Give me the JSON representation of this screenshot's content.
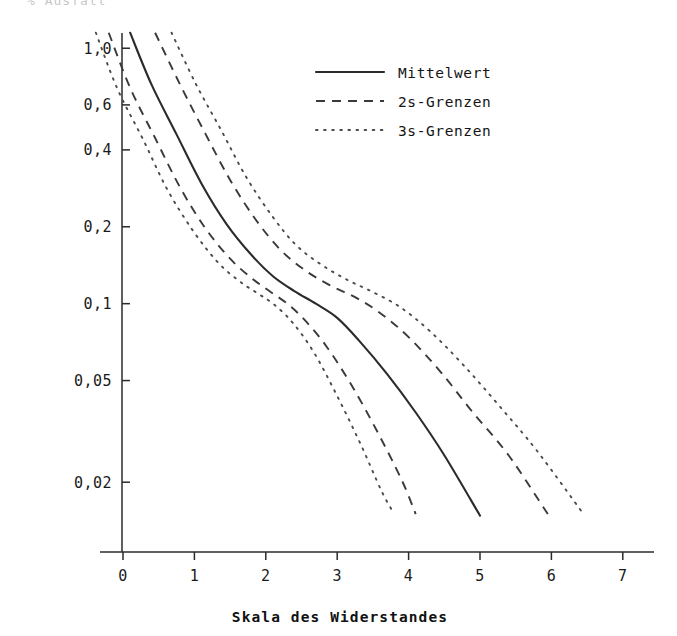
{
  "figure": {
    "top_caption": "% Ausfall",
    "background": "#ffffff",
    "ink": "#1a1a1a"
  },
  "legend": {
    "position": "top-right-inside",
    "items": [
      {
        "label": "Mittelwert",
        "style": "solid"
      },
      {
        "label": "2s-Grenzen",
        "style": "dashed"
      },
      {
        "label": "3s-Grenzen",
        "style": "dotted"
      }
    ]
  },
  "axes": {
    "x_title": "Skala des Widerstandes",
    "y_title": "",
    "x_ticks": [
      "0",
      "1",
      "2",
      "3",
      "4",
      "5",
      "6",
      "7"
    ],
    "y_ticks": [
      "1,0",
      "0,6",
      "0,4",
      "0,2",
      "0,1",
      "0,05",
      "0,02"
    ]
  },
  "chart_data": {
    "type": "line",
    "title": "",
    "subtitle": "",
    "xlabel": "Skala des Widerstandes",
    "ylabel": "",
    "xlim": [
      0,
      7
    ],
    "ylim": [
      0.013,
      1.2
    ],
    "yscale": "log",
    "xscale": "linear",
    "grid": false,
    "legend_position": "upper right",
    "xticks": [
      0,
      1,
      2,
      3,
      4,
      5,
      6,
      7
    ],
    "xticklabels": [
      "0",
      "1",
      "2",
      "3",
      "4",
      "5",
      "6",
      "7"
    ],
    "yticks": [
      1.0,
      0.6,
      0.4,
      0.2,
      0.1,
      0.05,
      0.02
    ],
    "yticklabels": [
      "1,0",
      "0,6",
      "0,4",
      "0,2",
      "0,1",
      "0,05",
      "0,02"
    ],
    "series": [
      {
        "name": "Mittelwert",
        "style": "solid",
        "color": "#2b2b2b",
        "x": [
          0.1,
          0.4,
          0.75,
          1.1,
          1.45,
          1.8,
          2.1,
          2.4,
          2.7,
          3.0,
          3.3,
          3.7,
          4.1,
          4.5,
          5.0
        ],
        "y": [
          1.15,
          0.72,
          0.46,
          0.295,
          0.205,
          0.155,
          0.128,
          0.112,
          0.1,
          0.088,
          0.072,
          0.053,
          0.0375,
          0.0255,
          0.0148
        ]
      },
      {
        "name": "2s-Grenzen (unten)",
        "style": "dashed",
        "color": "#3a3a3a",
        "x": [
          -0.2,
          0.1,
          0.45,
          0.8,
          1.15,
          1.5,
          1.8,
          2.05,
          2.3,
          2.55,
          2.85,
          3.2,
          3.55,
          3.9,
          4.1
        ],
        "y": [
          1.15,
          0.7,
          0.445,
          0.285,
          0.198,
          0.15,
          0.126,
          0.112,
          0.1,
          0.086,
          0.068,
          0.048,
          0.032,
          0.0205,
          0.015
        ]
      },
      {
        "name": "2s-Grenzen (oben)",
        "style": "dashed",
        "color": "#3a3a3a",
        "x": [
          0.45,
          0.8,
          1.15,
          1.5,
          1.85,
          2.2,
          2.55,
          2.9,
          3.25,
          3.6,
          4.0,
          4.45,
          4.9,
          5.4,
          5.95
        ],
        "y": [
          1.15,
          0.72,
          0.465,
          0.305,
          0.215,
          0.163,
          0.135,
          0.118,
          0.106,
          0.092,
          0.074,
          0.054,
          0.0375,
          0.0255,
          0.015
        ]
      },
      {
        "name": "3s-Grenzen (unten)",
        "style": "dotted",
        "color": "#4a4a4a",
        "x": [
          -0.38,
          -0.08,
          0.28,
          0.62,
          0.98,
          1.32,
          1.62,
          1.88,
          2.12,
          2.38,
          2.68,
          3.0,
          3.32,
          3.62,
          3.8
        ],
        "y": [
          1.15,
          0.695,
          0.44,
          0.28,
          0.193,
          0.146,
          0.123,
          0.11,
          0.099,
          0.084,
          0.064,
          0.0435,
          0.0285,
          0.0185,
          0.015
        ]
      },
      {
        "name": "3s-Grenzen (oben)",
        "style": "dotted",
        "color": "#4a4a4a",
        "x": [
          0.68,
          1.02,
          1.38,
          1.72,
          2.08,
          2.42,
          2.78,
          3.14,
          3.5,
          3.88,
          4.3,
          4.78,
          5.28,
          5.8,
          6.45
        ],
        "y": [
          1.15,
          0.725,
          0.475,
          0.315,
          0.222,
          0.17,
          0.142,
          0.124,
          0.111,
          0.097,
          0.078,
          0.057,
          0.0395,
          0.0265,
          0.015
        ]
      }
    ]
  }
}
